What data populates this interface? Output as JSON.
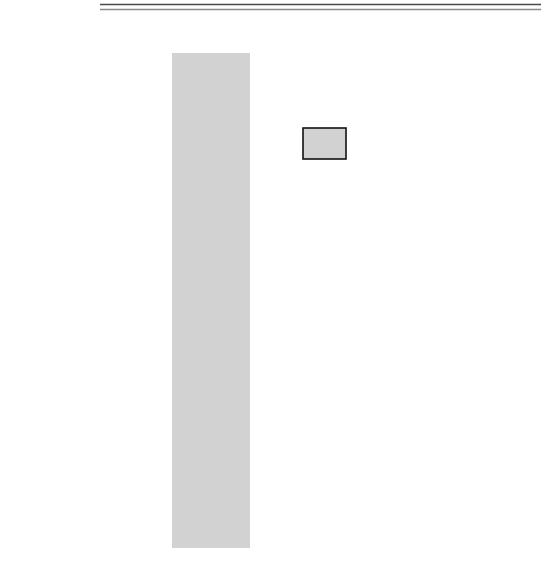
{
  "legend": {
    "swatch_name": "address-tenure-swatch",
    "label": "Address Tenure",
    "color": "#d2d2d2"
  },
  "colors": {
    "shade": "#d2d2d2",
    "stroke": "#111111",
    "background": "#ffffff",
    "rule": "#4a4a4a"
  },
  "clock": {
    "name": "BCLK",
    "tick_labels": [
      "1",
      "2",
      "3",
      "4",
      "5",
      "6",
      "7",
      "8",
      "9",
      "10",
      "11"
    ],
    "cycles": 11
  },
  "shaded_region": {
    "from_tick": 3,
    "to_tick": 5,
    "meaning": "Address Tenure"
  },
  "signals": [
    {
      "name": "BCLK",
      "label": "BCLK",
      "type": "clock"
    },
    {
      "name": "BR#",
      "label": "BR#",
      "type": "level",
      "initial": "high",
      "transitions": [
        {
          "at_tick": 1.15,
          "to": "low"
        },
        {
          "at_tick": 3.0,
          "to": "high"
        }
      ],
      "ends_at_tick": 5.0
    },
    {
      "name": "BG#",
      "label": "BG#",
      "type": "level",
      "initial": "high",
      "transitions": [
        {
          "at_tick": 2.1,
          "to": "low"
        },
        {
          "at_tick": 3.0,
          "to": "high"
        }
      ],
      "ends_at_tick": 5.0
    },
    {
      "name": "XATS#",
      "label": "XATS#",
      "type": "level",
      "initial": "high",
      "transitions": [
        {
          "at_tick": 3.1,
          "to": "low"
        },
        {
          "at_tick": 4.6,
          "to": "high"
        }
      ],
      "ends_at_tick": 5.0
    },
    {
      "name": "ABB#",
      "label": "ABB#",
      "type": "level",
      "initial": "high",
      "transitions": [
        {
          "at_tick": 3.1,
          "to": "low"
        },
        {
          "at_tick": 5.9,
          "to": "high"
        }
      ],
      "ends_at_tick": 6.6
    },
    {
      "name": "ARTRY#",
      "label": "ARTRY#",
      "type": "level",
      "initial": "high",
      "transitions": [
        {
          "at_tick": 6.0,
          "to": "low"
        },
        {
          "at_tick": 7.0,
          "to": "high"
        }
      ],
      "ends_at_tick": 8.0
    },
    {
      "name": "AACK#",
      "label": "AACK#",
      "type": "level",
      "initial": "high",
      "transitions": [
        {
          "at_tick": 4.6,
          "to": "low"
        },
        {
          "at_tick": 5.9,
          "to": "high"
        }
      ],
      "ends_at_tick": 6.6
    }
  ],
  "packets_row": {
    "label_line1": "Two Address",
    "label_line2": "Packets",
    "packets": [
      {
        "name": "packet-0",
        "label": "Packet 0",
        "from_tick": 3.0,
        "to_tick": 4.0
      },
      {
        "name": "packet-1",
        "label": "Packet 1",
        "from_tick": 4.0,
        "to_tick": 5.0
      }
    ]
  }
}
